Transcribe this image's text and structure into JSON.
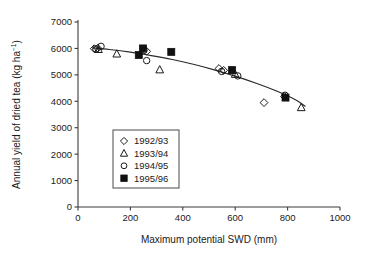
{
  "chart_data": {
    "type": "scatter",
    "title": "",
    "xlabel": "Maximum potential SWD (mm)",
    "ylabel": "Annual yield of dried tea (kg ha−1)",
    "ylabel_base": "Annual yield of dried tea (kg ha",
    "ylabel_sup": "−1",
    "ylabel_tail": ")",
    "xlim": [
      0,
      1000
    ],
    "ylim": [
      0,
      7000
    ],
    "xticks": [
      0,
      200,
      400,
      600,
      800,
      1000
    ],
    "yticks": [
      0,
      1000,
      2000,
      3000,
      4000,
      5000,
      6000,
      7000
    ],
    "xticklabels": [
      "0",
      "200",
      "400",
      "600",
      "800",
      "1000"
    ],
    "yticklabels": [
      "0",
      "1000",
      "2000",
      "3000",
      "4000",
      "5000",
      "6000",
      "7000"
    ],
    "grid": false,
    "legend_position": "lower-left-inside",
    "series": [
      {
        "name": "1992/93",
        "marker": "open-diamond",
        "color": "#1a1a1a",
        "points": [
          {
            "x": 62,
            "y": 5990
          },
          {
            "x": 75,
            "y": 6010
          },
          {
            "x": 262,
            "y": 5890
          },
          {
            "x": 538,
            "y": 5240
          },
          {
            "x": 556,
            "y": 5170
          },
          {
            "x": 710,
            "y": 3950
          },
          {
            "x": 788,
            "y": 4180
          }
        ]
      },
      {
        "name": "1993/94",
        "marker": "open-triangle",
        "color": "#1a1a1a",
        "points": [
          {
            "x": 78,
            "y": 5960
          },
          {
            "x": 148,
            "y": 5790
          },
          {
            "x": 312,
            "y": 5190
          },
          {
            "x": 600,
            "y": 5020
          },
          {
            "x": 852,
            "y": 3760
          }
        ]
      },
      {
        "name": "1994/95",
        "marker": "open-circle",
        "color": "#1a1a1a",
        "points": [
          {
            "x": 68,
            "y": 5980
          },
          {
            "x": 88,
            "y": 6080
          },
          {
            "x": 252,
            "y": 5930
          },
          {
            "x": 262,
            "y": 5540
          },
          {
            "x": 548,
            "y": 5130
          },
          {
            "x": 610,
            "y": 4960
          },
          {
            "x": 790,
            "y": 4230
          }
        ]
      },
      {
        "name": "1995/96",
        "marker": "filled-square",
        "color": "#111111",
        "points": [
          {
            "x": 232,
            "y": 5750
          },
          {
            "x": 248,
            "y": 6000
          },
          {
            "x": 356,
            "y": 5870
          },
          {
            "x": 588,
            "y": 5180
          },
          {
            "x": 792,
            "y": 4140
          }
        ]
      }
    ],
    "fit_curve": {
      "name": "fitted-response-curve",
      "points": [
        {
          "x": 55,
          "y": 6020
        },
        {
          "x": 120,
          "y": 5960
        },
        {
          "x": 200,
          "y": 5860
        },
        {
          "x": 280,
          "y": 5730
        },
        {
          "x": 360,
          "y": 5580
        },
        {
          "x": 440,
          "y": 5400
        },
        {
          "x": 520,
          "y": 5190
        },
        {
          "x": 600,
          "y": 4950
        },
        {
          "x": 680,
          "y": 4680
        },
        {
          "x": 760,
          "y": 4380
        },
        {
          "x": 830,
          "y": 4060
        },
        {
          "x": 868,
          "y": 3800
        }
      ]
    }
  },
  "legend": {
    "items": [
      {
        "label": "1992/93",
        "marker": "open-diamond"
      },
      {
        "label": "1993/94",
        "marker": "open-triangle"
      },
      {
        "label": "1994/95",
        "marker": "open-circle"
      },
      {
        "label": "1995/96",
        "marker": "filled-square"
      }
    ]
  },
  "colors": {
    "axis": "#3b3b3b",
    "marker": "#1a1a1a",
    "curve": "#2b2b2b",
    "background": "#ffffff"
  }
}
